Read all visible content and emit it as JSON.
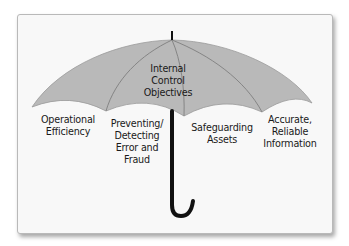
{
  "diagram": {
    "type": "umbrella-metaphor",
    "center_label": "Internal\nControl\nObjectives",
    "objectives": [
      {
        "label": "Operational\nEfficiency"
      },
      {
        "label": "Preventing/\nDetecting\nError and\nFraud"
      },
      {
        "label": "Safeguarding\nAssets"
      },
      {
        "label": "Accurate,\nReliable\nInformation"
      }
    ],
    "colors": {
      "canopy": "#b8b8b8",
      "ribs": "#8a8a8a",
      "handle": "#111111",
      "frame_bg": "#f8f8f8"
    }
  }
}
